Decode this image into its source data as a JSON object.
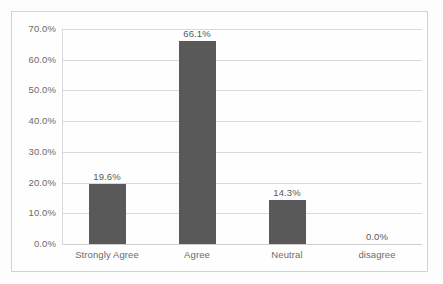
{
  "chart_data": {
    "type": "bar",
    "title": "",
    "xlabel": "",
    "ylabel": "",
    "categories": [
      "Strongly Agree",
      "Agree",
      "Neutral",
      "disagree"
    ],
    "values": [
      19.6,
      66.1,
      14.3,
      0.0
    ],
    "data_labels": [
      "19.6%",
      "66.1%",
      "14.3%",
      "0.0%"
    ],
    "ylim": [
      0,
      70
    ],
    "ytick_values": [
      0,
      10,
      20,
      30,
      40,
      50,
      60,
      70
    ],
    "ytick_labels": [
      "0.0%",
      "10.0%",
      "20.0%",
      "30.0%",
      "40.0%",
      "50.0%",
      "60.0%",
      "70.0%"
    ],
    "grid": true,
    "legend": false,
    "legend_position": "none",
    "series": [
      {
        "name": "",
        "values": [
          19.6,
          66.1,
          14.3,
          0.0
        ]
      }
    ],
    "colors": {
      "bar": "#595959",
      "gridline": "#d9d9d9",
      "tick_text": "#6b6b6b",
      "label_text": "#595959",
      "border": "#d3d3d3",
      "plot_background": "#fefefe",
      "page_background": "#fdfdfd"
    }
  }
}
